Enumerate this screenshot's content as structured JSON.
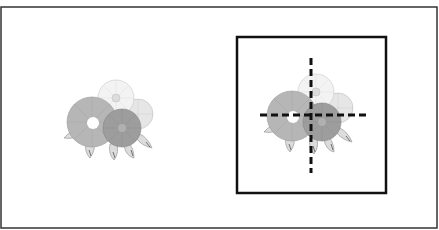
{
  "figure": {
    "colors": {
      "background": "#ffffff",
      "outer_border": "#333333",
      "frame": "#111111",
      "crosshair": "#111111",
      "flower_medium": "#b3b3b3",
      "flower_dark": "#9a9a9a",
      "flower_light": "#f0f0f0",
      "flower_pale": "#e2e2e2",
      "leaf": "#d9d9d9",
      "outline": "#8c8c8c"
    },
    "left_panel": {
      "label": "original-flower-cluster"
    },
    "right_panel": {
      "label": "framed-flower-cluster",
      "crosshair": {
        "style": "dashed",
        "orientation": [
          "horizontal",
          "vertical"
        ]
      }
    }
  }
}
